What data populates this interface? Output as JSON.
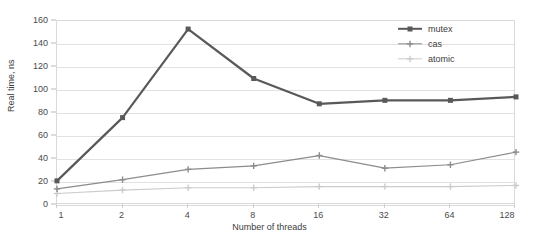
{
  "chart_data": {
    "type": "line",
    "title": "",
    "xlabel": "Number of threads",
    "ylabel": "Real time, ns",
    "categories": [
      "1",
      "2",
      "4",
      "8",
      "16",
      "32",
      "64",
      "128"
    ],
    "ylim": [
      0,
      160
    ],
    "yticks": [
      0,
      20,
      40,
      60,
      80,
      100,
      120,
      140,
      160
    ],
    "grid": "horizontal",
    "legend_position": "top-right",
    "series": [
      {
        "name": "mutex",
        "color": "#595959",
        "marker": "square",
        "values": [
          21,
          76,
          153,
          110,
          88,
          91,
          91,
          94
        ]
      },
      {
        "name": "cas",
        "color": "#8c8c8c",
        "marker": "plus",
        "values": [
          14,
          22,
          31,
          34,
          43,
          32,
          35,
          46
        ]
      },
      {
        "name": "atomic",
        "color": "#cccccc",
        "marker": "plus",
        "values": [
          10,
          13,
          15,
          15,
          16,
          16,
          16,
          17
        ]
      }
    ]
  },
  "axes": {
    "y_title": "Real time, ns",
    "x_title": "Number of threads",
    "y_tick_labels": [
      "0",
      "20",
      "40",
      "60",
      "80",
      "100",
      "120",
      "140",
      "160"
    ],
    "x_tick_labels": [
      "1",
      "2",
      "4",
      "8",
      "16",
      "32",
      "64",
      "128"
    ]
  },
  "legend": {
    "items": [
      {
        "label": "mutex"
      },
      {
        "label": "cas"
      },
      {
        "label": "atomic"
      }
    ]
  },
  "colors": {
    "mutex": "#595959",
    "cas": "#8c8c8c",
    "atomic": "#cccccc",
    "gridline": "#e2e2e2",
    "frame": "#d9d9d9",
    "text": "#3c3c3c",
    "background": "#ffffff"
  }
}
